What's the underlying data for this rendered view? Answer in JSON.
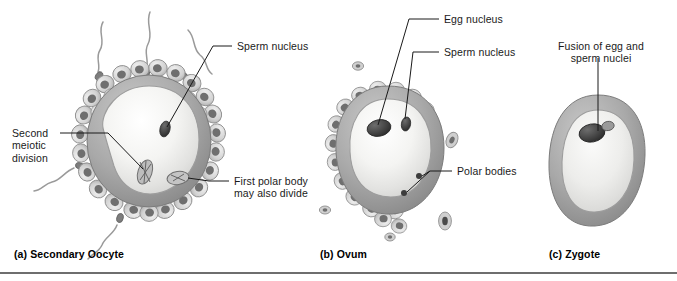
{
  "figure": {
    "title_semantic": "fertilization-stages-diagram",
    "background_color": "#ffffff",
    "rule_color": "#6e6e6e",
    "text_color": "#1a1a1a",
    "leader_line_color": "#1a1a1a"
  },
  "panels": [
    {
      "id": "a",
      "caption": "(a) Secondary Oocyte",
      "labels": [
        {
          "name": "sperm-nucleus",
          "text": "Sperm nucleus"
        },
        {
          "name": "second-meiotic-division",
          "text": "Second\nmeiotic\ndivision"
        },
        {
          "name": "first-polar-body",
          "text": "First polar body\nmay also divide"
        }
      ],
      "structures": [
        "corona-radiata",
        "zona-pellucida",
        "cytoplasm",
        "sperm-nucleus-body",
        "meiotic-spindle",
        "first-polar-body-body",
        "sperm-cells"
      ]
    },
    {
      "id": "b",
      "caption": "(b) Ovum",
      "labels": [
        {
          "name": "egg-nucleus",
          "text": "Egg nucleus"
        },
        {
          "name": "sperm-nucleus",
          "text": "Sperm nucleus"
        },
        {
          "name": "polar-bodies",
          "text": "Polar bodies"
        }
      ],
      "structures": [
        "corona-radiata",
        "zona-pellucida",
        "cytoplasm",
        "egg-nucleus-body",
        "sperm-nucleus-body",
        "polar-body-dots",
        "free-cells"
      ]
    },
    {
      "id": "c",
      "caption": "(c) Zygote",
      "labels": [
        {
          "name": "fusion-of-nuclei",
          "text": "Fusion of egg and\nsperm nuclei"
        }
      ],
      "structures": [
        "zona-pellucida",
        "cytoplasm",
        "fused-nuclei"
      ]
    }
  ],
  "colors": {
    "zona_outer": "#8e8e8e",
    "zona_inner": "#a8a8a8",
    "cytoplasm_light": "#f2f2f0",
    "cytoplasm_mid": "#dcdcda",
    "granulosa_fill": "#cfcfcf",
    "granulosa_nucleus": "#6a6a6a",
    "nucleus_dark": "#4a4a4a",
    "sperm_tail": "#9a9a9a"
  }
}
